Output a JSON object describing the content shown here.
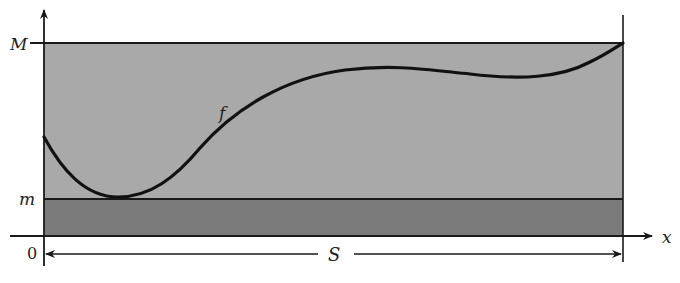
{
  "diagram": {
    "type": "area-bounds-illustration",
    "labels": {
      "upper_bound": "M",
      "lower_bound": "m",
      "origin": "0",
      "x_axis": "x",
      "function": "f",
      "interval": "S"
    },
    "colors": {
      "upper_region": "#a9a9a9",
      "lower_region": "#7b7b7b",
      "curve": "#111111",
      "lines": "#1a1a1a",
      "background": "#ffffff"
    }
  }
}
